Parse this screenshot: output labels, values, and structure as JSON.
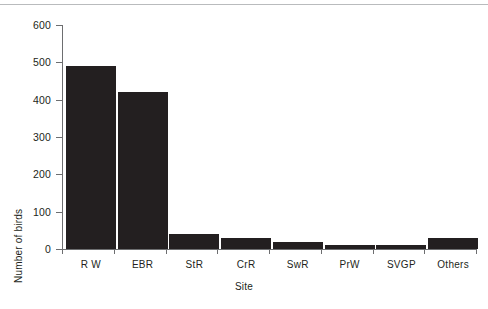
{
  "figure": {
    "background_color": "#ffffff",
    "top_rule_color": "#b9bbbd",
    "axis_color": "#6d6e70",
    "bar_color": "#231f20",
    "text_color": "#231f20"
  },
  "chart_data": {
    "type": "bar",
    "title": "",
    "xlabel": "Site",
    "ylabel": "Number of birds",
    "categories": [
      "R W",
      "EBR",
      "StR",
      "CrR",
      "SwR",
      "PrW",
      "SVGP",
      "Others"
    ],
    "values": [
      490,
      420,
      40,
      30,
      18,
      12,
      12,
      30
    ],
    "ylim": [
      0,
      600
    ],
    "yticks": [
      0,
      100,
      200,
      300,
      400,
      500,
      600
    ],
    "ytick_labels": [
      "0",
      "100",
      "200",
      "300",
      "400",
      "500",
      "600"
    ],
    "grid": false,
    "legend": null,
    "series": [
      {
        "name": "Number of birds",
        "values": [
          490,
          420,
          40,
          30,
          18,
          12,
          12,
          30
        ],
        "color": "#231f20"
      }
    ]
  }
}
